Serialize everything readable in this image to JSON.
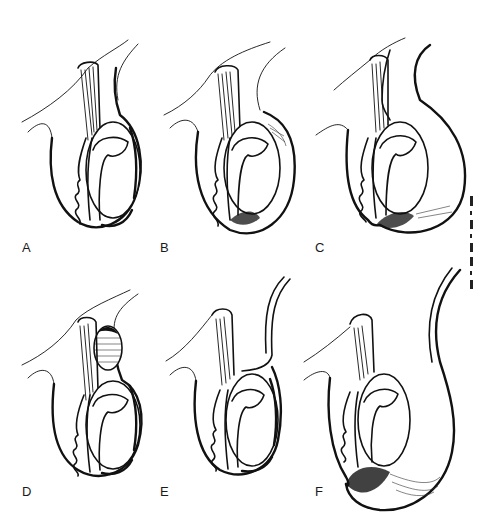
{
  "figure": {
    "panels": [
      {
        "id": "A",
        "label": "A",
        "variant": "normal"
      },
      {
        "id": "B",
        "label": "B",
        "variant": "enlarged-sac"
      },
      {
        "id": "C",
        "label": "C",
        "variant": "communicating-sac"
      },
      {
        "id": "D",
        "label": "D",
        "variant": "cord-cyst"
      },
      {
        "id": "E",
        "label": "E",
        "variant": "patent-processus"
      },
      {
        "id": "F",
        "label": "F",
        "variant": "large-communicating-sac"
      }
    ],
    "colors": {
      "ink": "#111111",
      "background": "#ffffff"
    }
  }
}
